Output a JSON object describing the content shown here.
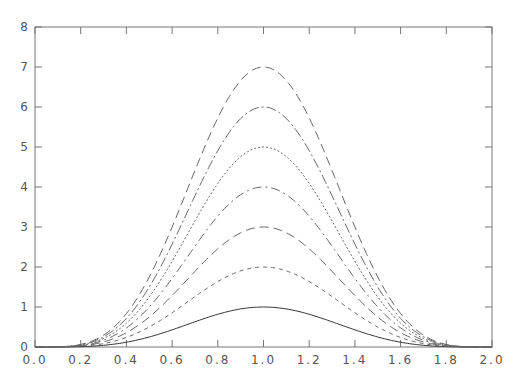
{
  "chart_data": {
    "type": "line",
    "title": "",
    "xlabel": "",
    "ylabel": "",
    "xlim": [
      0.0,
      2.0
    ],
    "ylim": [
      0,
      8
    ],
    "grid": false,
    "legend": null,
    "x_ticks": [
      "0.0",
      "0.2",
      "0.4",
      "0.6",
      "0.8",
      "1.0",
      "1.2",
      "1.4",
      "1.6",
      "1.8",
      "2.0"
    ],
    "y_ticks": [
      "0",
      "1",
      "2",
      "3",
      "4",
      "5",
      "6",
      "7",
      "8"
    ],
    "series": [
      {
        "name": "amplitude 1",
        "peak": 1,
        "peak_x": 1.0,
        "style": "solid"
      },
      {
        "name": "amplitude 2",
        "peak": 2,
        "peak_x": 1.0,
        "style": "short-dash"
      },
      {
        "name": "amplitude 3",
        "peak": 3,
        "peak_x": 1.0,
        "style": "long-dash"
      },
      {
        "name": "amplitude 4",
        "peak": 4,
        "peak_x": 1.0,
        "style": "dash-dot"
      },
      {
        "name": "amplitude 5",
        "peak": 5,
        "peak_x": 1.0,
        "style": "dotted"
      },
      {
        "name": "amplitude 6",
        "peak": 6,
        "peak_x": 1.0,
        "style": "dash-dot-long"
      },
      {
        "name": "amplitude 7",
        "peak": 7,
        "peak_x": 1.0,
        "style": "long-dash"
      }
    ],
    "x": [
      0.0,
      0.2,
      0.4,
      0.6,
      0.8,
      1.0,
      1.2,
      1.4,
      1.6,
      1.8,
      2.0
    ],
    "shape_note": "bell-shaped curves symmetric about x=1.0, approx. peak * sin^4(pi*x/2)"
  }
}
